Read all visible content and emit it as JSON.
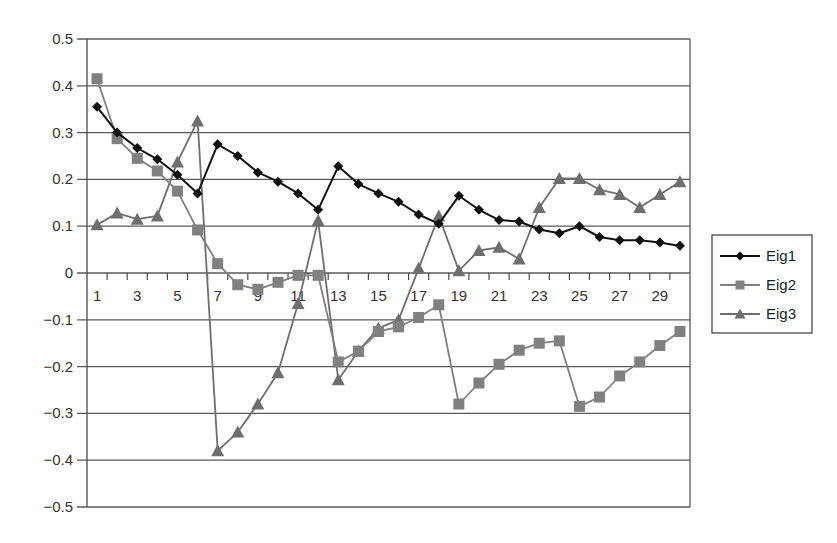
{
  "chart_data": {
    "type": "line",
    "title": "",
    "xlabel": "",
    "ylabel": "",
    "x": [
      1,
      2,
      3,
      4,
      5,
      6,
      7,
      8,
      9,
      10,
      11,
      12,
      13,
      14,
      15,
      16,
      17,
      18,
      19,
      20,
      21,
      22,
      23,
      24,
      25,
      26,
      27,
      28,
      29,
      30
    ],
    "x_tick_labels": [
      "1",
      "3",
      "5",
      "7",
      "9",
      "11",
      "13",
      "15",
      "17",
      "19",
      "21",
      "23",
      "25",
      "27",
      "29"
    ],
    "y_tick_labels": [
      "0.5",
      "0.4",
      "0.3",
      "0.2",
      "0.1",
      "0",
      "−0.1",
      "−0.2",
      "−0.3",
      "−0.4",
      "−0.5"
    ],
    "ylim": [
      -0.5,
      0.5
    ],
    "y_ticks": [
      0.5,
      0.4,
      0.3,
      0.2,
      0.1,
      0,
      -0.1,
      -0.2,
      -0.3,
      -0.4,
      -0.5
    ],
    "grid": {
      "horizontal": true,
      "vertical": false
    },
    "legend_position": "right",
    "series": [
      {
        "name": "Eig1",
        "marker": "diamond",
        "color": "#111111",
        "values": [
          0.355,
          0.3,
          0.267,
          0.243,
          0.21,
          0.17,
          0.275,
          0.25,
          0.215,
          0.195,
          0.17,
          0.135,
          0.228,
          0.19,
          0.17,
          0.152,
          0.125,
          0.105,
          0.165,
          0.135,
          0.113,
          0.11,
          0.093,
          0.085,
          0.1,
          0.077,
          0.07,
          0.07,
          0.065,
          0.058
        ]
      },
      {
        "name": "Eig2",
        "marker": "square",
        "color": "#808080",
        "values": [
          0.415,
          0.287,
          0.245,
          0.218,
          0.175,
          0.092,
          0.02,
          -0.025,
          -0.035,
          -0.02,
          -0.005,
          -0.005,
          -0.19,
          -0.167,
          -0.125,
          -0.115,
          -0.095,
          -0.068,
          -0.28,
          -0.235,
          -0.195,
          -0.165,
          -0.15,
          -0.145,
          -0.285,
          -0.265,
          -0.22,
          -0.19,
          -0.155,
          -0.125
        ]
      },
      {
        "name": "Eig3",
        "marker": "triangle",
        "color": "#6e6e6e",
        "values": [
          0.103,
          0.128,
          0.115,
          0.122,
          0.237,
          0.325,
          -0.38,
          -0.34,
          -0.28,
          -0.213,
          -0.065,
          0.112,
          -0.228,
          -0.167,
          -0.118,
          -0.1,
          0.01,
          0.122,
          0.005,
          0.048,
          0.055,
          0.03,
          0.14,
          0.202,
          0.202,
          0.178,
          0.168,
          0.14,
          0.168,
          0.195
        ]
      }
    ]
  },
  "legend": {
    "items": [
      {
        "label": "Eig1",
        "marker": "diamond-icon"
      },
      {
        "label": "Eig2",
        "marker": "square-icon"
      },
      {
        "label": "Eig3",
        "marker": "triangle-icon"
      }
    ]
  }
}
